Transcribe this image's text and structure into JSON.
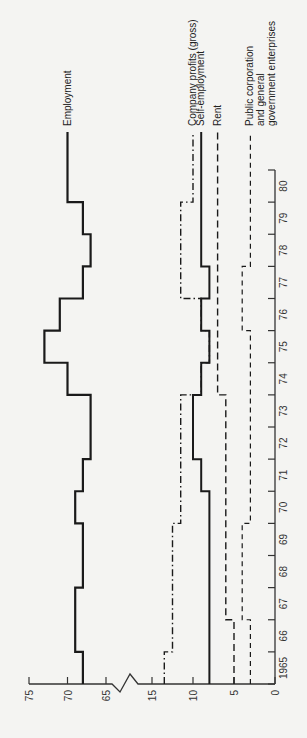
{
  "chart_data": {
    "type": "line",
    "subtype": "step",
    "orientation": "rotated-90-ccw",
    "title": "",
    "xlabel": "Year",
    "ylabel": "Percentage share",
    "x": [
      1965,
      1966,
      1967,
      1968,
      1969,
      1970,
      1971,
      1972,
      1973,
      1974,
      1975,
      1976,
      1977,
      1978,
      1979,
      1980
    ],
    "x_tick_labels": [
      "1965",
      "66",
      "67",
      "68",
      "69",
      "70",
      "71",
      "72",
      "73",
      "74",
      "75",
      "76",
      "77",
      "78",
      "79",
      "80"
    ],
    "y_ticks": [
      0,
      5,
      10,
      15,
      65,
      70,
      75
    ],
    "y_tick_labels": [
      "0",
      "5",
      "10",
      "15",
      "65",
      "70",
      "75"
    ],
    "y_axis_break": {
      "from": 15,
      "to": 65
    },
    "ylim": [
      0,
      75
    ],
    "grid": false,
    "legend_position": "end-of-lines",
    "series": [
      {
        "name": "Employment",
        "style": "solid-thick",
        "values": [
          68,
          69,
          69,
          68,
          68,
          69,
          68,
          67,
          67,
          70,
          73,
          71,
          68,
          67,
          68,
          70
        ]
      },
      {
        "name": "Company profits (gross)",
        "style": "dash-dot",
        "values": [
          13.5,
          12.5,
          12.5,
          12.5,
          12.5,
          11.5,
          11.5,
          11.5,
          11.5,
          9,
          8,
          9,
          11.5,
          11.5,
          11.5,
          10
        ]
      },
      {
        "name": "Self-employment",
        "style": "solid",
        "values": [
          8,
          8,
          8,
          8,
          8,
          8,
          9,
          10,
          10,
          9,
          8,
          9,
          8,
          9,
          9,
          9
        ]
      },
      {
        "name": "Rent",
        "style": "dashed-long",
        "values": [
          5,
          5,
          6,
          6,
          6,
          6,
          6,
          6,
          6,
          7,
          7,
          7,
          7,
          7,
          7,
          7
        ]
      },
      {
        "name": "Public corporation and general government enterprises",
        "style": "dashed-short",
        "label_lines": [
          "Public corporation",
          "and general",
          "government enterprises"
        ],
        "values": [
          3,
          3,
          4,
          4,
          4,
          3,
          3,
          3,
          3,
          3,
          3,
          4,
          4,
          3,
          3,
          3
        ]
      }
    ]
  }
}
